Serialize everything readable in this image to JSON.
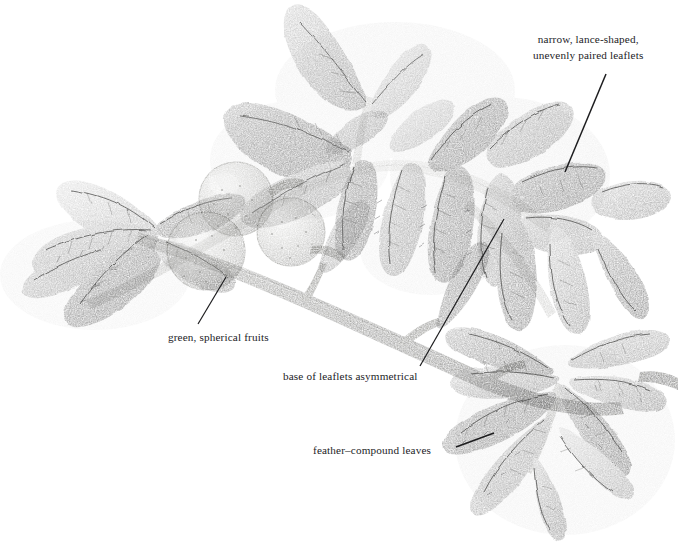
{
  "illustration": {
    "subject": "botanical pencil illustration of a walnut branch with compound leaves and spherical fruits",
    "medium": "graphite pencil drawing",
    "background_color": "#ffffff",
    "ink_color": "#1d1d1f",
    "canvas": {
      "width": 678,
      "height": 545
    }
  },
  "annotations": [
    {
      "id": "narrow-lance-shaped-leaflets",
      "line1": "narrow, lance-shaped,",
      "line2": "unevenly paired leaflets",
      "text_x": 533,
      "text_y": 32,
      "leader": {
        "x1": 606,
        "y1": 74,
        "x2": 565,
        "y2": 172
      }
    },
    {
      "id": "green-spherical-fruits",
      "line1": "green, spherical fruits",
      "line2": "",
      "text_x": 168,
      "text_y": 330,
      "leader": {
        "x1": 226,
        "y1": 277,
        "x2": 198,
        "y2": 324
      }
    },
    {
      "id": "base-of-leaflets-asymmetrical",
      "line1": "base of leaflets asymmetrical",
      "line2": "",
      "text_x": 283,
      "text_y": 369,
      "leader": {
        "x1": 504,
        "y1": 219,
        "x2": 420,
        "y2": 366
      }
    },
    {
      "id": "feather-compound-leaves",
      "line1": "feather–compound leaves",
      "line2": "",
      "text_x": 313,
      "text_y": 443,
      "leader": {
        "x1": 456,
        "y1": 447,
        "x2": 494,
        "y2": 433
      }
    }
  ],
  "plant_parts": {
    "fruits": [
      {
        "name": "fruit-upper",
        "cx": 236,
        "cy": 199,
        "r": 37
      },
      {
        "name": "fruit-lower-left",
        "cx": 206,
        "cy": 251,
        "r": 39
      },
      {
        "name": "fruit-right",
        "cx": 291,
        "cy": 232,
        "r": 34
      }
    ],
    "stems": [
      {
        "name": "main-branch",
        "note": "thick textured bark branch sweeping from mid-left down to lower right"
      },
      {
        "name": "arching-rachis",
        "note": "pale arching leaf stalk across upper centre"
      },
      {
        "name": "right-twig-tip",
        "note": "dark short twig stub at right edge"
      }
    ],
    "leaf_clusters": [
      {
        "name": "leaf-cluster-upper-left",
        "note": "three ascending leaflets at top centre-left"
      },
      {
        "name": "leaf-cluster-upper-right",
        "note": "dense paired leaflets along upper right of rachis"
      },
      {
        "name": "leaf-cluster-left",
        "note": "spreading leaflets at far left"
      },
      {
        "name": "leaf-cluster-lower-right",
        "note": "feather-compound leaf fan at lower right"
      }
    ]
  }
}
